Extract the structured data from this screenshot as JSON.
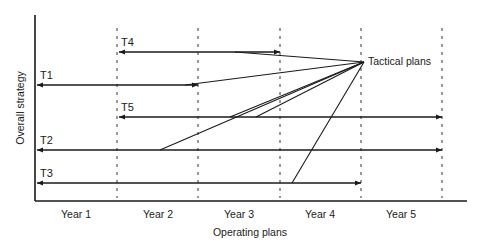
{
  "diagram": {
    "y_axis_label": "Overall strategy",
    "x_axis_label": "Operating plans",
    "convergence_label": "Tactical plans",
    "years": [
      "Year 1",
      "Year 2",
      "Year 3",
      "Year 4",
      "Year 5"
    ],
    "tactics": [
      {
        "id": "T1",
        "label": "T1",
        "span": "Year 1 – Year 2"
      },
      {
        "id": "T2",
        "label": "T2",
        "span": "Year 1 – Year 5"
      },
      {
        "id": "T3",
        "label": "T3",
        "span": "Year 1 – Year 4"
      },
      {
        "id": "T4",
        "label": "T4",
        "span": "Year 2 – Year 3"
      },
      {
        "id": "T5",
        "label": "T5",
        "span": "Year 2 – Year 5"
      }
    ],
    "colors": {
      "line": "#1a1a1a",
      "background": "#ffffff"
    }
  }
}
